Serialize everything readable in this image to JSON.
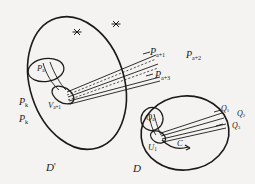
{
  "figure": {
    "kind": "mathematical-diagram",
    "background_color": "#f4f3f1",
    "ink_color": "#1a1a1a",
    "regions": {
      "left_domain": {
        "label": "D",
        "prime": "'",
        "shape": "tilted-ellipse"
      },
      "right_domain": {
        "label": "D",
        "prime": "",
        "shape": "ellipse"
      }
    },
    "left_labels": {
      "inner_set": {
        "base": "P",
        "sub": "a"
      },
      "vertex_set": {
        "base": "V",
        "sub": "a+1"
      },
      "stack_upper": {
        "base": "P",
        "sub": "k"
      },
      "stack_lower": {
        "base": "P",
        "sub": "k"
      },
      "ray_1": {
        "base": "P",
        "sub": "a+1"
      },
      "ray_2": {
        "base": "P",
        "sub": "a+2"
      },
      "ray_3": {
        "base": "P",
        "sub": "a+3"
      }
    },
    "right_labels": {
      "inner_set": {
        "base": "Q",
        "sub": "a"
      },
      "vertex_set": {
        "base": "U",
        "sub": "1"
      },
      "curve": {
        "base": "C",
        "sub": ""
      },
      "ray_1": {
        "base": "Q",
        "sub": "1"
      },
      "ray_2": {
        "base": "Q",
        "sub": "2"
      },
      "ray_3": {
        "base": "Q",
        "sub": "3"
      }
    },
    "marks": [
      {
        "name": "asterisk-mark-left",
        "glyph": "×"
      },
      {
        "name": "asterisk-mark-right",
        "glyph": "×"
      }
    ]
  }
}
